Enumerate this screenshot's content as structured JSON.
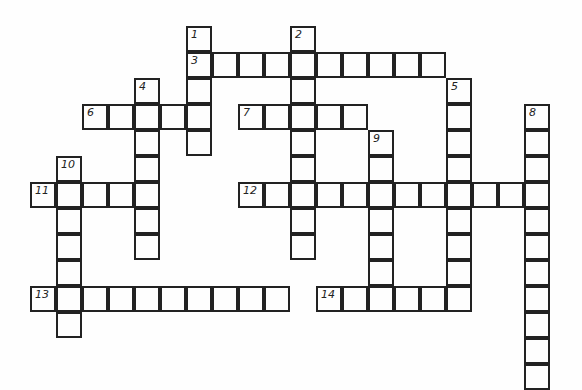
{
  "puzzle": {
    "type": "crossword",
    "words": [
      {
        "number": "1",
        "direction": "down",
        "row": 0,
        "col": 6,
        "length": 5
      },
      {
        "number": "2",
        "direction": "down",
        "row": 0,
        "col": 10,
        "length": 9
      },
      {
        "number": "3",
        "direction": "across",
        "row": 1,
        "col": 6,
        "length": 10
      },
      {
        "number": "4",
        "direction": "down",
        "row": 2,
        "col": 4,
        "length": 7
      },
      {
        "number": "5",
        "direction": "down",
        "row": 2,
        "col": 16,
        "length": 9
      },
      {
        "number": "6",
        "direction": "across",
        "row": 3,
        "col": 2,
        "length": 5
      },
      {
        "number": "7",
        "direction": "across",
        "row": 3,
        "col": 8,
        "length": 5
      },
      {
        "number": "8",
        "direction": "down",
        "row": 3,
        "col": 19,
        "length": 11
      },
      {
        "number": "9",
        "direction": "down",
        "row": 4,
        "col": 13,
        "length": 7
      },
      {
        "number": "10",
        "direction": "down",
        "row": 5,
        "col": 1,
        "length": 7
      },
      {
        "number": "11",
        "direction": "across",
        "row": 6,
        "col": 0,
        "length": 5
      },
      {
        "number": "12",
        "direction": "across",
        "row": 6,
        "col": 8,
        "length": 12
      },
      {
        "number": "13",
        "direction": "across",
        "row": 10,
        "col": 0,
        "length": 10
      },
      {
        "number": "14",
        "direction": "across",
        "row": 10,
        "col": 11,
        "length": 6
      }
    ]
  }
}
